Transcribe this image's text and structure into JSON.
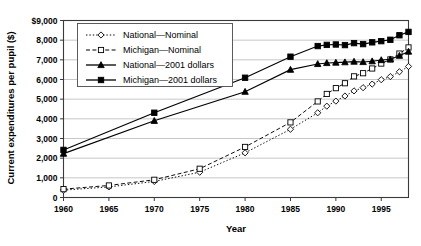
{
  "chart_data": {
    "type": "line",
    "title": "",
    "xlabel": "Year",
    "ylabel": "Current expenditures per pupil ($)",
    "xlim": [
      1960,
      1998
    ],
    "ylim": [
      0,
      9000
    ],
    "grid": true,
    "legend_position": "top-left-inside",
    "xticks": [
      1960,
      1965,
      1970,
      1975,
      1980,
      1985,
      1990,
      1995
    ],
    "xtick_labels": [
      "1960",
      "1965",
      "1970",
      "1975",
      "1980",
      "1985",
      "1990",
      "1995"
    ],
    "yticks": [
      0,
      1000,
      2000,
      3000,
      4000,
      5000,
      6000,
      7000,
      8000,
      9000
    ],
    "ytick_labels": [
      "0",
      "1,000",
      "2,000",
      "3,000",
      "4,000",
      "5,000",
      "6,000",
      "7,000",
      "8,000",
      "$9,000"
    ],
    "series": [
      {
        "name": "National—Nominal",
        "marker": "open-diamond",
        "dash": "dotted",
        "x": [
          1960,
          1965,
          1970,
          1975,
          1980,
          1985,
          1988,
          1989,
          1990,
          1991,
          1992,
          1993,
          1994,
          1995,
          1996,
          1997,
          1998
        ],
        "values": [
          375,
          538,
          816,
          1286,
          2272,
          3470,
          4307,
          4645,
          4902,
          5160,
          5421,
          5584,
          5767,
          5989,
          6147,
          6393,
          6662
        ]
      },
      {
        "name": "Michigan—Nominal",
        "marker": "open-square",
        "dash": "dashed",
        "x": [
          1960,
          1965,
          1970,
          1975,
          1980,
          1985,
          1988,
          1989,
          1990,
          1991,
          1992,
          1993,
          1994,
          1995,
          1996,
          1997,
          1998
        ],
        "values": [
          425,
          612,
          901,
          1462,
          2571,
          3820,
          4885,
          5265,
          5560,
          5810,
          6160,
          6320,
          6560,
          6810,
          7020,
          7320,
          7630
        ]
      },
      {
        "name": "National—2001 dollars",
        "marker": "filled-triangle",
        "dash": "solid",
        "x": [
          1960,
          1970,
          1980,
          1985,
          1988,
          1989,
          1990,
          1991,
          1992,
          1993,
          1994,
          1995,
          1996,
          1997,
          1998
        ],
        "values": [
          2230,
          3900,
          5380,
          6500,
          6790,
          6840,
          6860,
          6880,
          6910,
          6890,
          6930,
          6990,
          7030,
          7210,
          7420
        ]
      },
      {
        "name": "Michigan—2001 dollars",
        "marker": "filled-square",
        "dash": "solid",
        "x": [
          1960,
          1970,
          1980,
          1985,
          1988,
          1989,
          1990,
          1991,
          1992,
          1993,
          1994,
          1995,
          1996,
          1997,
          1998
        ],
        "values": [
          2420,
          4310,
          6090,
          7160,
          7700,
          7760,
          7780,
          7750,
          7850,
          7800,
          7890,
          7950,
          8020,
          8250,
          8420
        ]
      }
    ]
  },
  "legend": {
    "entries": [
      {
        "label": "National—Nominal"
      },
      {
        "label": "Michigan—Nominal"
      },
      {
        "label": "National—2001 dollars"
      },
      {
        "label": "Michigan—2001 dollars"
      }
    ]
  }
}
